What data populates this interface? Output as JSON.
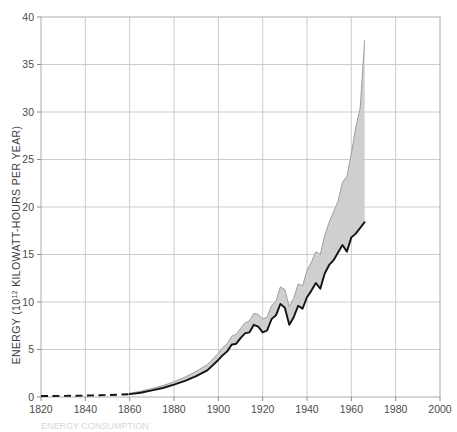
{
  "figure": {
    "background_color": "#ffffff",
    "plot_border_color": "#b9b9b9",
    "grid_color": "#c6c6c6",
    "band_fill_color": "#cfcfcf",
    "line_color": "#141414",
    "dashed_line_color": "#141414",
    "caption": "ENERGY CONSUMPTION"
  },
  "axes": {
    "ylabel_prefix": "ENERGY (10",
    "ylabel_sup": "12",
    "ylabel_suffix": " KILOWATT-HOURS PER YEAR)",
    "ylabel_full": "ENERGY (10¹² KILOWATT-HOURS PER YEAR)",
    "xlabel": "",
    "y_ticks": [
      "0",
      "5",
      "10",
      "15",
      "20",
      "25",
      "30",
      "35",
      "40"
    ],
    "x_ticks": [
      "1820",
      "1840",
      "1860",
      "1880",
      "1900",
      "1920",
      "1940",
      "1960",
      "1980",
      "2000"
    ]
  },
  "chart_data": {
    "type": "area",
    "title": "",
    "xlabel": "",
    "ylabel": "ENERGY (10¹² KILOWATT-HOURS PER YEAR)",
    "xlim": [
      1820,
      2000
    ],
    "ylim": [
      0,
      40
    ],
    "xticks": [
      1820,
      1840,
      1860,
      1880,
      1900,
      1920,
      1940,
      1960,
      1980,
      2000
    ],
    "yticks": [
      0,
      5,
      10,
      15,
      20,
      25,
      30,
      35,
      40
    ],
    "grid": true,
    "legend": "none",
    "series": [
      {
        "name": "Total energy (upper bound of shaded band)",
        "style": "solid-thin-gray",
        "x": [
          1860,
          1865,
          1870,
          1875,
          1880,
          1885,
          1890,
          1895,
          1900,
          1902,
          1904,
          1906,
          1908,
          1910,
          1912,
          1914,
          1916,
          1918,
          1920,
          1922,
          1924,
          1926,
          1928,
          1930,
          1932,
          1934,
          1936,
          1938,
          1940,
          1942,
          1944,
          1946,
          1948,
          1950,
          1952,
          1954,
          1956,
          1958,
          1960,
          1962,
          1964,
          1966
        ],
        "values": [
          0.4,
          0.6,
          0.9,
          1.2,
          1.6,
          2.1,
          2.7,
          3.4,
          4.6,
          5.2,
          5.6,
          6.4,
          6.6,
          7.2,
          7.8,
          8.0,
          8.8,
          8.7,
          8.2,
          8.4,
          9.6,
          10.1,
          11.6,
          11.3,
          9.5,
          10.4,
          11.9,
          11.7,
          13.3,
          14.2,
          15.3,
          15.0,
          17.0,
          18.4,
          19.5,
          20.6,
          22.6,
          23.2,
          25.6,
          28.4,
          30.4,
          37.5
        ]
      },
      {
        "name": "Commercial energy (heavy black line)",
        "style": "solid-heavy-black",
        "x": [
          1820,
          1830,
          1840,
          1850,
          1860,
          1865,
          1870,
          1875,
          1880,
          1885,
          1890,
          1895,
          1900,
          1902,
          1904,
          1906,
          1908,
          1910,
          1912,
          1914,
          1916,
          1918,
          1920,
          1922,
          1924,
          1926,
          1928,
          1930,
          1932,
          1934,
          1936,
          1938,
          1940,
          1942,
          1944,
          1946,
          1948,
          1950,
          1952,
          1954,
          1956,
          1958,
          1960,
          1962,
          1964,
          1966
        ],
        "values": [
          0.1,
          0.12,
          0.15,
          0.2,
          0.3,
          0.45,
          0.7,
          0.95,
          1.3,
          1.7,
          2.2,
          2.8,
          3.9,
          4.4,
          4.8,
          5.5,
          5.6,
          6.2,
          6.7,
          6.8,
          7.6,
          7.4,
          6.8,
          7.0,
          8.2,
          8.6,
          9.8,
          9.4,
          7.6,
          8.4,
          9.6,
          9.3,
          10.5,
          11.2,
          12.0,
          11.4,
          13.0,
          13.9,
          14.4,
          15.2,
          16.0,
          15.3,
          16.8,
          17.2,
          17.8,
          18.4
        ]
      },
      {
        "name": "Extrapolated early estimate (dashed)",
        "style": "dashed-black",
        "x": [
          1820,
          1830,
          1840,
          1850,
          1860
        ],
        "values": [
          0.1,
          0.12,
          0.15,
          0.2,
          0.3
        ]
      }
    ]
  }
}
